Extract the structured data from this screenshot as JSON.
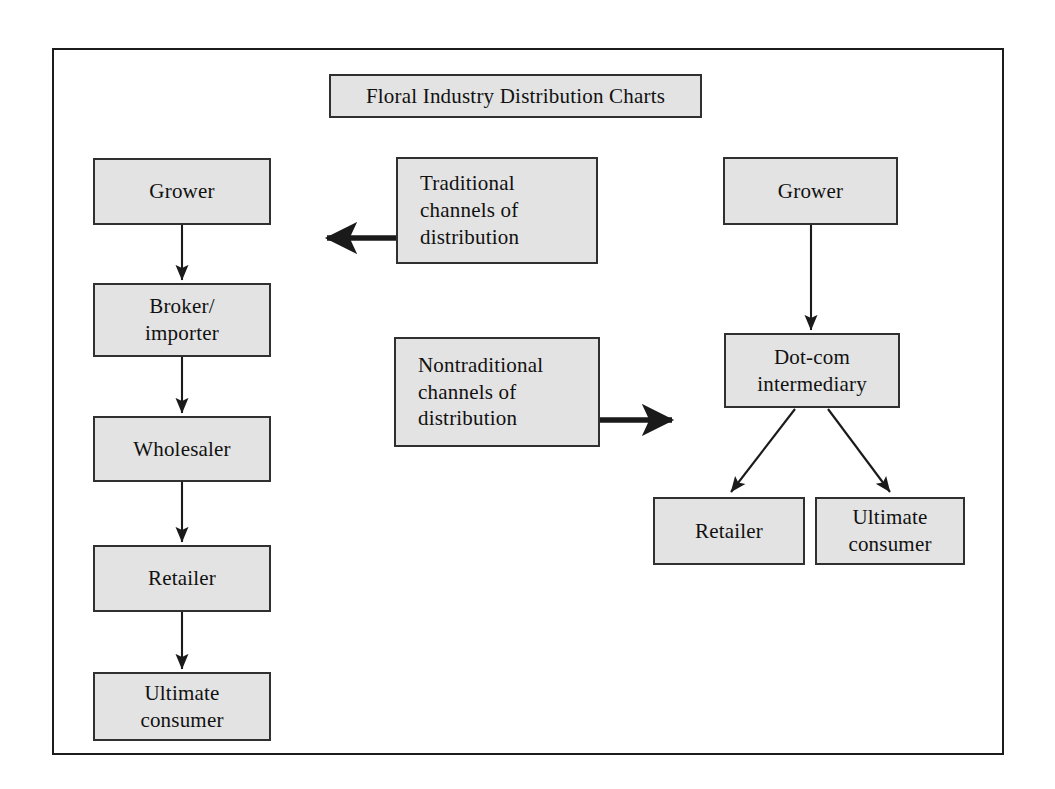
{
  "diagram": {
    "title_box": {
      "label": "Floral Industry Distribution Charts",
      "x": 329,
      "y": 74,
      "w": 373,
      "h": 44
    },
    "traditional_chain": [
      {
        "name": "grower",
        "label": "Grower",
        "x": 93,
        "y": 158,
        "w": 178,
        "h": 67
      },
      {
        "name": "broker-importer",
        "label": "Broker/\nimporter",
        "x": 93,
        "y": 283,
        "w": 178,
        "h": 74
      },
      {
        "name": "wholesaler",
        "label": "Wholesaler",
        "x": 93,
        "y": 416,
        "w": 178,
        "h": 66
      },
      {
        "name": "retailer",
        "label": "Retailer",
        "x": 93,
        "y": 545,
        "w": 178,
        "h": 67
      },
      {
        "name": "ultimate-consumer",
        "label": "Ultimate\nconsumer",
        "x": 93,
        "y": 672,
        "w": 178,
        "h": 69
      }
    ],
    "legend_boxes": [
      {
        "name": "traditional-channels",
        "label": "Traditional\nchannels of\ndistribution",
        "x": 396,
        "y": 157,
        "w": 202,
        "h": 107,
        "arrow_direction": "left"
      },
      {
        "name": "nontraditional-channels",
        "label": "Nontraditional\nchannels of\ndistribution",
        "x": 394,
        "y": 337,
        "w": 206,
        "h": 110,
        "arrow_direction": "right"
      }
    ],
    "nontraditional_chain": [
      {
        "name": "grower-online",
        "label": "Grower",
        "x": 723,
        "y": 157,
        "w": 175,
        "h": 68
      },
      {
        "name": "dotcom-intermediary",
        "label": "Dot-com\nintermediary",
        "x": 724,
        "y": 333,
        "w": 176,
        "h": 75
      },
      {
        "name": "retailer-online",
        "label": "Retailer",
        "x": 653,
        "y": 497,
        "w": 152,
        "h": 68
      },
      {
        "name": "ultimate-consumer-online",
        "label": "Ultimate\nconsumer",
        "x": 815,
        "y": 497,
        "w": 150,
        "h": 68
      }
    ],
    "colors": {
      "box_fill": "#e3e3e3",
      "box_border": "#303030",
      "frame_border": "#1c1c1c",
      "arrow": "#1a1a1a",
      "text": "#111111",
      "page_background": "#ffffff"
    },
    "connectors": [
      {
        "name": "grower-to-broker",
        "from": "grower",
        "to": "broker-importer",
        "style": "thin-vertical"
      },
      {
        "name": "broker-to-wholesaler",
        "from": "broker-importer",
        "to": "wholesaler",
        "style": "thin-vertical"
      },
      {
        "name": "wholesaler-to-retailer",
        "from": "wholesaler",
        "to": "retailer",
        "style": "thin-vertical"
      },
      {
        "name": "retailer-to-ultimate-consumer",
        "from": "retailer",
        "to": "ultimate-consumer",
        "style": "thin-vertical"
      },
      {
        "name": "traditional-legend-arrow",
        "from": "traditional-channels",
        "to": "traditional-chain",
        "style": "thick-left"
      },
      {
        "name": "nontraditional-legend-arrow",
        "from": "nontraditional-channels",
        "to": "nontraditional-chain",
        "style": "thick-right"
      },
      {
        "name": "grower-to-dotcom",
        "from": "grower-online",
        "to": "dotcom-intermediary",
        "style": "thin-vertical"
      },
      {
        "name": "dotcom-to-retailer",
        "from": "dotcom-intermediary",
        "to": "retailer-online",
        "style": "thin-diagonal"
      },
      {
        "name": "dotcom-to-ultimate-consumer",
        "from": "dotcom-intermediary",
        "to": "ultimate-consumer-online",
        "style": "thin-diagonal"
      }
    ]
  }
}
